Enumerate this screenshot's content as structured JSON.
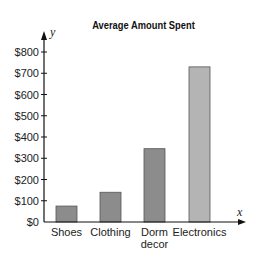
{
  "chart_data": {
    "type": "bar",
    "title": "Average Amount Spent",
    "xlabel": "x",
    "ylabel": "y",
    "categories": [
      "Shoes",
      "Clothing",
      "Dorm decor",
      "Electronics"
    ],
    "category_lines": [
      [
        "Shoes"
      ],
      [
        "Clothing"
      ],
      [
        "Dorm",
        "decor"
      ],
      [
        "Electronics"
      ]
    ],
    "values": [
      75,
      140,
      345,
      730
    ],
    "ylim": [
      0,
      800
    ],
    "yticks": [
      0,
      100,
      200,
      300,
      400,
      500,
      600,
      700,
      800
    ],
    "ytick_labels": [
      "$0",
      "$100",
      "$200",
      "$300",
      "$400",
      "$500",
      "$600",
      "$700",
      "$800"
    ],
    "grid": false,
    "bar_colors": [
      "#8c8c8c",
      "#8c8c8c",
      "#8c8c8c",
      "#b4b4b4"
    ],
    "bar_stroke": "#555555"
  }
}
